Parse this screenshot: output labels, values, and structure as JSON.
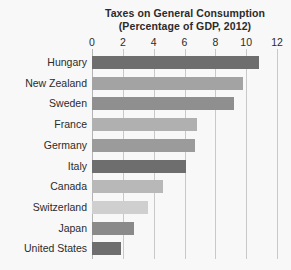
{
  "chart_data": {
    "type": "bar",
    "orientation": "horizontal",
    "title": "Taxes on General Consumption",
    "subtitle": "(Percentage of GDP, 2012)",
    "xlabel": "",
    "ylabel": "",
    "xlim": [
      0,
      12
    ],
    "xticks": [
      0,
      2,
      4,
      6,
      8,
      10,
      12
    ],
    "xtick_labels": [
      "0",
      "2",
      "4",
      "6",
      "8",
      "10",
      "12"
    ],
    "grid": true,
    "grid_axis": "x",
    "legend": false,
    "categories": [
      "Hungary",
      "New Zealand",
      "Sweden",
      "France",
      "Germany",
      "Italy",
      "Canada",
      "Switzerland",
      "Japan",
      "United States"
    ],
    "values": [
      10.8,
      9.8,
      9.2,
      6.8,
      6.7,
      6.1,
      4.6,
      3.6,
      2.7,
      1.9
    ],
    "bar_colors": [
      "#6e6e6e",
      "#a3a3a3",
      "#8f8f8f",
      "#b0b0b0",
      "#9b9b9b",
      "#6e6e6e",
      "#b8b8b8",
      "#cfcfcf",
      "#8a8a8a",
      "#6e6e6e"
    ]
  },
  "style": {
    "background": "#f8f8f8",
    "text_color": "#2b2b2b",
    "gridline_color": "#c9c9c9",
    "axis_color": "#b4b4b4"
  }
}
